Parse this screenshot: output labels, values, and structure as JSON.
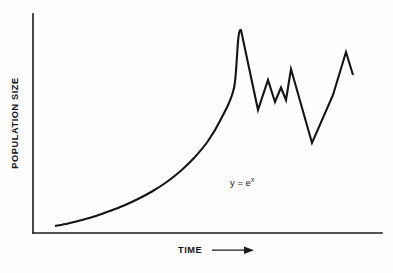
{
  "figure": {
    "background_color": "#fefefe",
    "ink_color": "#141414",
    "width": 393,
    "height": 273
  },
  "axes": {
    "y_axis_label": "POPULATION SIZE",
    "x_axis_label": "TIME",
    "x_axis_arrow": "right-arrow",
    "x_origin_px": 33,
    "x_end_px": 382,
    "y_top_px": 14,
    "y_baseline_px": 233
  },
  "annotation": {
    "equation_base": "y = e",
    "equation_exponent": "x",
    "x_px": 230,
    "y_px": 186
  },
  "chart_data": {
    "type": "line",
    "title": "",
    "subtitle": "",
    "xlabel": "TIME",
    "ylabel": "POPULATION SIZE",
    "legend": [],
    "legend_position": "none",
    "grid": false,
    "xticks": [],
    "yticks": [],
    "xlim": [
      0,
      100
    ],
    "ylim": [
      0,
      100
    ],
    "annotations": [
      {
        "text": "y = e^x",
        "x": 57,
        "y": 23
      }
    ],
    "series": [
      {
        "name": "population",
        "phase_1_label": "exponential growth",
        "phase_2_label": "fluctuating oscillation after crash",
        "x": [
          6.3,
          10.0,
          14.0,
          18.0,
          22.0,
          26.0,
          30.0,
          34.0,
          38.0,
          42.0,
          46.0,
          50.0,
          54.0,
          58.0,
          59.5,
          64.4,
          67.3,
          69.3,
          71.0,
          73.0,
          75.0,
          76.4,
          80.5,
          86.5,
          89.7,
          93.4,
          95.4,
          97.4,
          99.4
        ],
        "y": [
          3.2,
          4.0,
          5.1,
          6.4,
          7.9,
          9.6,
          11.6,
          13.9,
          16.6,
          19.9,
          24.0,
          29.2,
          36.0,
          45.5,
          48.5,
          92.7,
          56.2,
          65.3,
          58.4,
          63.0,
          58.9,
          63.9,
          73.4,
          41.1,
          56.0,
          87.2,
          82.2,
          75.5,
          72.1
        ],
        "color": "#141414",
        "linewidth": 2.1
      }
    ],
    "path_points_px": [
      {
        "x": 55.0,
        "y": 226.0
      },
      {
        "x": 68.0,
        "y": 223.5
      },
      {
        "x": 82.0,
        "y": 220.0
      },
      {
        "x": 96.0,
        "y": 216.0
      },
      {
        "x": 110.0,
        "y": 211.0
      },
      {
        "x": 124.0,
        "y": 205.5
      },
      {
        "x": 138.0,
        "y": 199.0
      },
      {
        "x": 152.0,
        "y": 191.5
      },
      {
        "x": 166.0,
        "y": 182.5
      },
      {
        "x": 180.0,
        "y": 171.5
      },
      {
        "x": 194.0,
        "y": 158.0
      },
      {
        "x": 208.0,
        "y": 141.0
      },
      {
        "x": 221.0,
        "y": 119.0
      },
      {
        "x": 234.0,
        "y": 88.0
      },
      {
        "x": 241.0,
        "y": 30.0
      },
      {
        "x": 258.0,
        "y": 110.0
      },
      {
        "x": 268.0,
        "y": 80.0
      },
      {
        "x": 275.0,
        "y": 102.0
      },
      {
        "x": 281.0,
        "y": 87.5
      },
      {
        "x": 286.0,
        "y": 100.0
      },
      {
        "x": 291.0,
        "y": 69.0
      },
      {
        "x": 312.0,
        "y": 143.0
      },
      {
        "x": 333.0,
        "y": 95.0
      },
      {
        "x": 346.0,
        "y": 52.0
      },
      {
        "x": 353.0,
        "y": 75.0
      }
    ]
  }
}
